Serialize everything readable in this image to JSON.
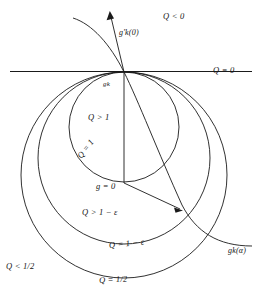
{
  "figure": {
    "type": "mathematical-diagram",
    "stroke_color": "#1a1a1a",
    "background_color": "#ffffff",
    "labels": {
      "q_negative": "Q < 0",
      "gk_prime_zero": "g'k(0)",
      "q_zero": "Q = 0",
      "gk": "gk",
      "q_greater_1": "Q > 1",
      "q_equal_1": "Q = 1",
      "g_equal_0": "g = 0",
      "q_greater_1_minus_eps": "Q > 1 − ε",
      "q_equal_1_minus_eps": "Q = 1 − ε",
      "gk_alpha": "gk(α)",
      "q_less_half": "Q < 1/2",
      "q_equal_half": "Q = 1/2"
    },
    "geometry": {
      "tangent_point": [
        124,
        72
      ],
      "horizontal_line": {
        "x1": 10,
        "y1": 72,
        "x2": 252,
        "y2": 72
      },
      "circles": [
        {
          "name": "Q = 1",
          "cx": 124,
          "cy": 127,
          "r": 55
        },
        {
          "name": "Q = 1 - eps",
          "cx": 124,
          "cy": 158,
          "r": 86
        },
        {
          "name": "Q = 1/2",
          "cx": 124,
          "cy": 175,
          "r": 103
        }
      ],
      "radius_segment": {
        "x1": 124,
        "y1": 72,
        "x2": 124,
        "y2": 182
      },
      "arrow_to_alpha": {
        "x1": 124,
        "y1": 182,
        "x2": 183,
        "y2": 210
      },
      "arrow_gk_prime": {
        "x1": 124,
        "y1": 72,
        "x2": 110,
        "y2": 12
      }
    }
  }
}
